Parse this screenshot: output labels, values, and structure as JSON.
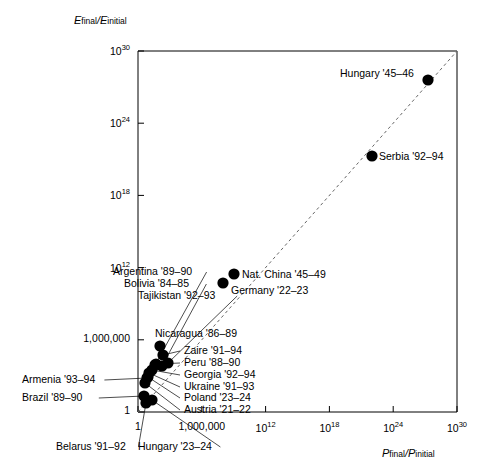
{
  "axes": {
    "ylabel_main": "E",
    "ylabel_sub1": "final",
    "ylabel_slash": "/E",
    "ylabel_sub2": "initial",
    "xlabel_main": "P",
    "xlabel_sub1": "final",
    "xlabel_slash": "/P",
    "xlabel_sub2": "initial"
  },
  "chart_data": {
    "type": "scatter",
    "title": "",
    "xlabel": "P final/P initial",
    "ylabel": "E final/E initial",
    "xscale": "log",
    "yscale": "log",
    "xlim": [
      1,
      1e+30
    ],
    "ylim": [
      1,
      1e+30
    ],
    "grid": false,
    "legend": "none",
    "reference_line": {
      "style": "dashed",
      "description": "y = x diagonal",
      "from": [
        1,
        1
      ],
      "to": [
        1e+30,
        1e+30
      ]
    },
    "xticks": [
      {
        "value": 1,
        "label": "1",
        "sup": ""
      },
      {
        "value": 1000000.0,
        "label": "1,000,000",
        "sup": ""
      },
      {
        "value": 1000000000000.0,
        "label": "10",
        "sup": "12"
      },
      {
        "value": 1e+18,
        "label": "10",
        "sup": "18"
      },
      {
        "value": 1e+24,
        "label": "10",
        "sup": "24"
      },
      {
        "value": 1e+30,
        "label": "10",
        "sup": "30"
      }
    ],
    "yticks": [
      {
        "value": 1,
        "label": "1",
        "sup": ""
      },
      {
        "value": 1000000.0,
        "label": "1,000,000",
        "sup": ""
      },
      {
        "value": 1000000000000.0,
        "label": "10",
        "sup": "12"
      },
      {
        "value": 1e+18,
        "label": "10",
        "sup": "18"
      },
      {
        "value": 1e+24,
        "label": "10",
        "sup": "24"
      },
      {
        "value": 1e+30,
        "label": "10",
        "sup": "30"
      }
    ],
    "points": [
      {
        "name": "Hungary '45–46",
        "px": 428,
        "py": 80,
        "label_x": 340,
        "label_y": 74,
        "anchor": "left",
        "leader": false
      },
      {
        "name": "Serbia '92–94",
        "px": 372,
        "py": 156,
        "label_x": 379,
        "label_y": 157,
        "anchor": "left",
        "leader": false
      },
      {
        "name": "Nat. China '45–49",
        "px": 234,
        "py": 274,
        "label_x": 242,
        "label_y": 275,
        "anchor": "left",
        "leader": false
      },
      {
        "name": "Germany '22–23",
        "px": 223,
        "py": 283,
        "label_x": 231,
        "label_y": 291,
        "anchor": "left",
        "leader": false
      },
      {
        "name": "Nicaragua '86–89",
        "px": 160,
        "py": 346,
        "label_x": 155,
        "label_y": 334,
        "anchor": "left",
        "leader": false
      },
      {
        "name": "Argentina '89–90",
        "px": 155,
        "py": 365,
        "label_x": 113,
        "label_y": 272,
        "anchor": "left",
        "leader": true
      },
      {
        "name": "Bolivia '84–85",
        "px": 162,
        "py": 366,
        "label_x": 124,
        "label_y": 284,
        "anchor": "left",
        "leader": true
      },
      {
        "name": "Tajikistan '92–93",
        "px": 168,
        "py": 363,
        "label_x": 138,
        "label_y": 296,
        "anchor": "left",
        "leader": true
      },
      {
        "name": "Zaire '91–94",
        "px": 163,
        "py": 355,
        "label_x": 184,
        "label_y": 351,
        "anchor": "left",
        "leader": true
      },
      {
        "name": "Peru '88–90",
        "px": 156,
        "py": 364,
        "label_x": 184,
        "label_y": 363,
        "anchor": "left",
        "leader": true
      },
      {
        "name": "Georgia '92–94",
        "px": 152,
        "py": 370,
        "label_x": 184,
        "label_y": 375,
        "anchor": "left",
        "leader": true
      },
      {
        "name": "Ukraine '91–93",
        "px": 149,
        "py": 373,
        "label_x": 184,
        "label_y": 387,
        "anchor": "left",
        "leader": true
      },
      {
        "name": "Poland '23–24",
        "px": 148,
        "py": 377,
        "label_x": 184,
        "label_y": 398,
        "anchor": "left",
        "leader": true
      },
      {
        "name": "Austria '21–22",
        "px": 145,
        "py": 383,
        "label_x": 184,
        "label_y": 410,
        "anchor": "left",
        "leader": true
      },
      {
        "name": "Armenia '93–94",
        "px": 147,
        "py": 378,
        "label_x": 22,
        "label_y": 380,
        "anchor": "left",
        "leader": true
      },
      {
        "name": "Brazil '89–90",
        "px": 144,
        "py": 396,
        "label_x": 22,
        "label_y": 398,
        "anchor": "left",
        "leader": true
      },
      {
        "name": "Belarus '91–92",
        "px": 146,
        "py": 403,
        "label_x": 56,
        "label_y": 447,
        "anchor": "left",
        "leader": true
      },
      {
        "name": "Hungary '23–24",
        "px": 152,
        "py": 400,
        "label_x": 138,
        "label_y": 447,
        "anchor": "left",
        "leader": true
      }
    ]
  }
}
